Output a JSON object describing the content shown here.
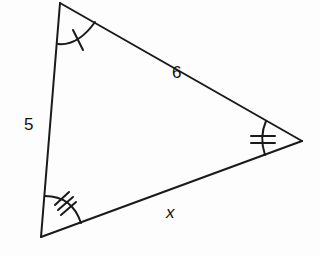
{
  "diagram": {
    "type": "triangle",
    "vertices": {
      "top": [
        60,
        3
      ],
      "bottom_left": [
        41,
        237
      ],
      "right": [
        302,
        141
      ]
    },
    "sides": {
      "left": {
        "label": "5"
      },
      "top": {
        "label": "6"
      },
      "bottom": {
        "label": "x"
      }
    },
    "angle_marks": {
      "top": {
        "arcs": 1,
        "ticks": 1
      },
      "right": {
        "arcs": 1,
        "ticks": 2
      },
      "bottom_left": {
        "arcs": 1,
        "ticks": 3
      }
    },
    "stroke_color": "#1a1a1a"
  }
}
